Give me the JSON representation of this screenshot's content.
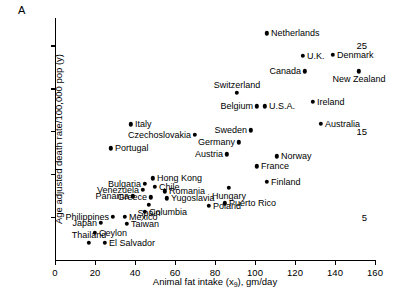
{
  "panel": {
    "letter": "A"
  },
  "chart_data": {
    "type": "scatter",
    "title": "",
    "xlabel": "Animal fat intake (x₉), gm/day",
    "xlabel_text": "Animal fat intake (x",
    "xlabel_sub": "9",
    "xlabel_tail": "), gm/day",
    "ylabel": "Age adjusted death rate/100,000 pop (y)",
    "xlim": [
      0,
      160
    ],
    "ylim": [
      0,
      28.2
    ],
    "xticks": [
      0,
      20,
      40,
      60,
      80,
      100,
      120,
      140,
      160
    ],
    "xticklabels": [
      "0",
      "20",
      "40",
      "60",
      "80",
      "100",
      "120",
      "140",
      "160"
    ],
    "yticks": [
      5,
      10,
      15,
      20,
      25
    ],
    "yticklabels": [
      "5",
      "",
      "15",
      "",
      "25"
    ],
    "grid": false,
    "legend": "none",
    "points": [
      {
        "name": "Netherlands",
        "x": 106,
        "y": 26.4,
        "side": "r"
      },
      {
        "name": "U.K.",
        "x": 124,
        "y": 23.8,
        "side": "r"
      },
      {
        "name": "Denmark",
        "x": 139,
        "y": 23.9,
        "side": "r"
      },
      {
        "name": "Canada",
        "x": 125,
        "y": 22.0,
        "side": "l"
      },
      {
        "name": "New Zealand",
        "x": 152,
        "y": 22.0,
        "side": "c-below"
      },
      {
        "name": "Switzerland",
        "x": 91,
        "y": 19.5,
        "side": "c-above"
      },
      {
        "name": "Belgium",
        "x": 101,
        "y": 17.9,
        "side": "l"
      },
      {
        "name": "U.S.A.",
        "x": 105,
        "y": 17.9,
        "side": "r"
      },
      {
        "name": "Ireland",
        "x": 129,
        "y": 18.4,
        "side": "r"
      },
      {
        "name": "Sweden",
        "x": 98,
        "y": 15.1,
        "side": "l"
      },
      {
        "name": "Australia",
        "x": 133,
        "y": 15.9,
        "side": "r"
      },
      {
        "name": "Germany",
        "x": 92,
        "y": 13.7,
        "side": "l"
      },
      {
        "name": "Austria",
        "x": 86,
        "y": 12.3,
        "side": "l"
      },
      {
        "name": "Norway",
        "x": 111,
        "y": 12.1,
        "side": "r"
      },
      {
        "name": "France",
        "x": 101,
        "y": 10.9,
        "side": "r"
      },
      {
        "name": "Italy",
        "x": 38,
        "y": 15.8,
        "side": "r"
      },
      {
        "name": "Czechoslovakia",
        "x": 70,
        "y": 14.6,
        "side": "l"
      },
      {
        "name": "Finland",
        "x": 106,
        "y": 9.1,
        "side": "r"
      },
      {
        "name": "Hungary",
        "x": 87,
        "y": 8.4,
        "side": "c-below"
      },
      {
        "name": "Portugal",
        "x": 28,
        "y": 13.0,
        "side": "r"
      },
      {
        "name": "Poland",
        "x": 77,
        "y": 6.3,
        "side": "r"
      },
      {
        "name": "Hong Kong",
        "x": 49,
        "y": 9.5,
        "side": "r"
      },
      {
        "name": "Bulgaria",
        "x": 45,
        "y": 8.9,
        "side": "l"
      },
      {
        "name": "Chile",
        "x": 50,
        "y": 8.5,
        "side": "r"
      },
      {
        "name": "Venezuela",
        "x": 44,
        "y": 8.2,
        "side": "l"
      },
      {
        "name": "Romania",
        "x": 55,
        "y": 8.0,
        "side": "r"
      },
      {
        "name": "Greece",
        "x": 48,
        "y": 7.3,
        "side": "l"
      },
      {
        "name": "Yugoslavia",
        "x": 56,
        "y": 7.2,
        "side": "r"
      },
      {
        "name": "Panama",
        "x": 39,
        "y": 7.4,
        "side": "l"
      },
      {
        "name": "Spain",
        "x": 47,
        "y": 6.4,
        "side": "c-below"
      },
      {
        "name": "Puerto Rico",
        "x": 85,
        "y": 6.6,
        "side": "r"
      },
      {
        "name": "Columbia",
        "x": 45,
        "y": 5.6,
        "side": "r"
      },
      {
        "name": "Philippines",
        "x": 29,
        "y": 5.0,
        "side": "l"
      },
      {
        "name": "Mexico",
        "x": 35,
        "y": 5.0,
        "side": "r"
      },
      {
        "name": "Japan",
        "x": 23,
        "y": 4.3,
        "side": "l"
      },
      {
        "name": "Taiwan",
        "x": 36,
        "y": 4.2,
        "side": "r"
      },
      {
        "name": "Ceylon",
        "x": 20,
        "y": 3.2,
        "side": "r"
      },
      {
        "name": "Thailand",
        "x": 17,
        "y": 2.0,
        "side": "c-above"
      },
      {
        "name": "El Salvador",
        "x": 25,
        "y": 2.0,
        "side": "r"
      }
    ]
  }
}
